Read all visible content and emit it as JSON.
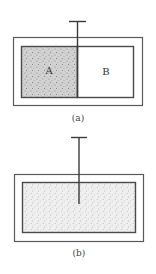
{
  "figure_a": {
    "caption": "(a)",
    "region_left_label": "A",
    "region_right_label": "B",
    "region_left_state": "filled with gas (stippled)",
    "region_right_state": "empty"
  },
  "figure_b": {
    "caption": "(b)",
    "region_state": "gas fills entire container (stippled)"
  },
  "colors": {
    "line": "#4a4a4a",
    "gas_fill_dense": "#cfcfcf",
    "gas_fill_light": "#eeeeee",
    "empty_fill": "#ffffff"
  }
}
